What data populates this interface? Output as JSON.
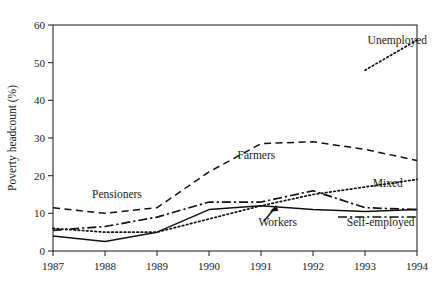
{
  "chart_data": {
    "type": "line",
    "title": "",
    "xlabel": "",
    "ylabel": "Poverty headcount (%)",
    "x": [
      1987,
      1988,
      1989,
      1990,
      1991,
      1992,
      1993,
      1994
    ],
    "xtick_labels": [
      "1987",
      "1988",
      "1989",
      "1990",
      "1991",
      "1992",
      "1993",
      "1994"
    ],
    "ytick_labels": [
      "0",
      "10",
      "20",
      "30",
      "40",
      "50",
      "60"
    ],
    "ytick_values": [
      0,
      10,
      20,
      30,
      40,
      50,
      60
    ],
    "xlim": [
      1987,
      1994
    ],
    "ylim": [
      0,
      60
    ],
    "grid": false,
    "legend_position": "inline-annotations",
    "series": [
      {
        "name": "Farmers",
        "style": "dashed",
        "label": "Farmers",
        "x": [
          1987,
          1988,
          1989,
          1990,
          1991,
          1992,
          1993,
          1994
        ],
        "values": [
          11.5,
          10.0,
          11.5,
          21.0,
          28.5,
          29.0,
          27.0,
          24.0
        ]
      },
      {
        "name": "Pensioners",
        "style": "dash-dot",
        "label": "Pensioners",
        "x": [
          1987,
          1988,
          1989,
          1990,
          1991,
          1992,
          1993,
          1994
        ],
        "values": [
          5.5,
          6.5,
          9.0,
          13.0,
          13.0,
          16.0,
          11.5,
          11.0
        ]
      },
      {
        "name": "Mixed",
        "style": "dotted",
        "label": "Mixed",
        "x": [
          1987,
          1988,
          1989,
          1990,
          1991,
          1992,
          1993,
          1994
        ],
        "values": [
          6.0,
          5.0,
          5.0,
          8.5,
          12.0,
          15.0,
          17.0,
          19.0
        ]
      },
      {
        "name": "Workers",
        "style": "solid",
        "label": "Workers",
        "x": [
          1987,
          1988,
          1989,
          1990,
          1991,
          1992,
          1993,
          1994
        ],
        "values": [
          4.0,
          2.5,
          5.0,
          11.0,
          12.0,
          11.0,
          10.5,
          11.0
        ]
      },
      {
        "name": "Unemployed",
        "style": "dotted",
        "label": "Unemployed",
        "x": [
          1993,
          1994
        ],
        "values": [
          48.0,
          56.0
        ]
      },
      {
        "name": "Self-employed",
        "style": "dash-dot",
        "label": "Self-employed",
        "x": [],
        "values": []
      }
    ],
    "annotations": [
      {
        "text": "Unemployed",
        "x": 1993.05,
        "y": 55.0
      },
      {
        "text": "Farmers",
        "x": 1990.55,
        "y": 24.3
      },
      {
        "text": "Mixed",
        "x": 1993.15,
        "y": 17.0
      },
      {
        "text": "Pensioners",
        "x": 1987.75,
        "y": 14.2
      },
      {
        "text": "Workers",
        "x": 1990.95,
        "y": 6.6
      },
      {
        "text": "Self-employed",
        "x": 1992.65,
        "y": 6.6
      }
    ]
  }
}
